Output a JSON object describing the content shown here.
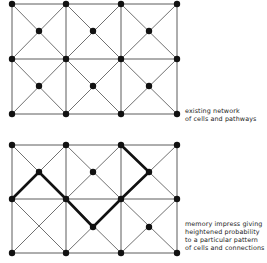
{
  "diagrams": [
    {
      "name": "existing-network",
      "caption_lines": [
        "existing network",
        "of cells and pathways"
      ],
      "corners_x": [
        12,
        66,
        121,
        177
      ],
      "corners_y": [
        4,
        59,
        114
      ],
      "centers": [
        [
          39,
          31
        ],
        [
          93,
          31
        ],
        [
          149,
          31
        ],
        [
          39,
          86
        ],
        [
          93,
          86
        ],
        [
          149,
          86
        ]
      ],
      "center_dots": [
        [
          39,
          31
        ],
        [
          93,
          31
        ],
        [
          149,
          31
        ],
        [
          39,
          86
        ],
        [
          93,
          86
        ],
        [
          149,
          86
        ]
      ],
      "bold_path": []
    },
    {
      "name": "memory-impress",
      "caption_lines": [
        "memory impress giving",
        "heightened probability",
        "to a particular pattern",
        "of cells and connections"
      ],
      "corners_x": [
        12,
        66,
        121,
        177
      ],
      "corners_y": [
        145,
        199,
        253
      ],
      "centers": [
        [
          39,
          172
        ],
        [
          93,
          172
        ],
        [
          149,
          172
        ],
        [
          39,
          227
        ],
        [
          93,
          227
        ],
        [
          149,
          227
        ]
      ],
      "center_dots": [
        [
          39,
          172
        ],
        [
          93,
          172
        ],
        [
          149,
          172
        ],
        [
          93,
          227
        ],
        [
          149,
          227
        ]
      ],
      "bold_path": [
        [
          12,
          199
        ],
        [
          39,
          172
        ],
        [
          66,
          199
        ],
        [
          93,
          227
        ],
        [
          121,
          199
        ],
        [
          149,
          172
        ],
        [
          121,
          145
        ]
      ]
    }
  ],
  "colors": {
    "line": "#333333",
    "dot": "#111111",
    "bold": "#111111"
  }
}
